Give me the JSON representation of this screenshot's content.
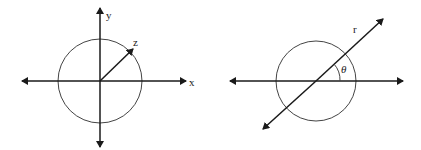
{
  "figures": [
    {
      "name": "cartesian-axes-with-circle",
      "labels": {
        "x_axis": "x",
        "y_axis": "y",
        "vector": "z"
      }
    },
    {
      "name": "polar-line-with-circle",
      "labels": {
        "line": "r",
        "angle": "θ"
      }
    }
  ],
  "colors": {
    "stroke": "#1a1a1a",
    "circle": "#444444"
  }
}
